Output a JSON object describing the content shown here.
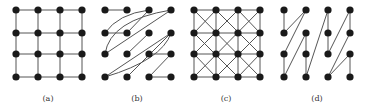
{
  "figure": {
    "panels": [
      {
        "id": "a",
        "label": "(a)",
        "description": "4x4 mesh grid"
      },
      {
        "id": "b",
        "label": "(b)",
        "description": "twisted / shuffled interconnect"
      },
      {
        "id": "c",
        "label": "(c)",
        "description": "mesh with diagonal connections (king's graph)"
      },
      {
        "id": "d",
        "label": "(d)",
        "description": "column-wise zigzag interconnect"
      }
    ],
    "grid": {
      "rows": 4,
      "cols": 4
    },
    "colors": {
      "node": "#1a1a1a",
      "edge": "#555555",
      "background": "#ffffff"
    }
  }
}
